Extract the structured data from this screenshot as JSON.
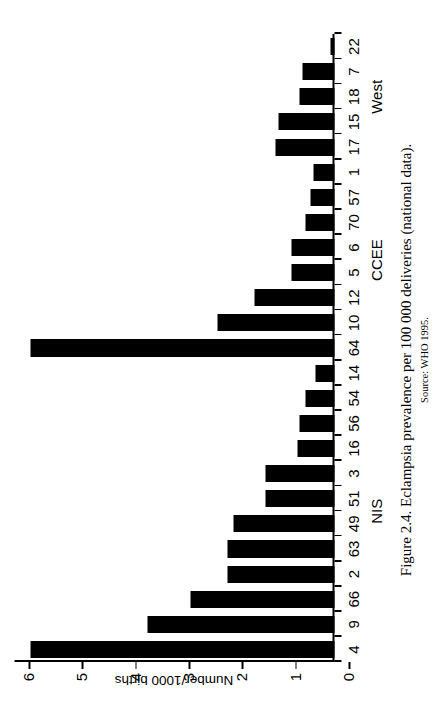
{
  "caption": {
    "main": "Figure 2.4. Eclampsia prevalence per 100 000 deliveries (national data).",
    "source": "Source: WHO 1995."
  },
  "chart_data": {
    "type": "bar",
    "orientation": "vertical-rotated-90ccw",
    "title": "Figure 2.4. Eclampsia prevalence per 100 000 deliveries (national data).",
    "xlabel": "",
    "ylabel": "Number/1000 births",
    "ylim": [
      0,
      6
    ],
    "yticks": [
      "0",
      "1",
      "2",
      "3",
      "4",
      "5",
      "6"
    ],
    "ytick_values": [
      0,
      1,
      2,
      3,
      4,
      5,
      6
    ],
    "grid": false,
    "legend": null,
    "categories": [
      "4",
      "9",
      "66",
      "2",
      "63",
      "49",
      "51",
      "3",
      "16",
      "56",
      "54",
      "14",
      "64",
      "10",
      "12",
      "5",
      "6",
      "70",
      "57",
      "1",
      "17",
      "15",
      "18",
      "7",
      "22"
    ],
    "values": [
      5.7,
      3.5,
      2.7,
      2.0,
      2.0,
      1.9,
      1.3,
      1.3,
      0.7,
      0.65,
      0.55,
      0.35,
      5.7,
      2.2,
      1.5,
      0.8,
      0.8,
      0.55,
      0.45,
      0.4,
      1.1,
      1.05,
      0.65,
      0.6,
      0.07
    ],
    "groups": [
      {
        "label": "NIS",
        "categories": [
          "4",
          "9",
          "66",
          "2",
          "63",
          "49",
          "51",
          "3",
          "16",
          "56",
          "54",
          "14"
        ]
      },
      {
        "label": "CCEE",
        "categories": [
          "64",
          "10",
          "12",
          "5",
          "6",
          "70",
          "57",
          "1"
        ]
      },
      {
        "label": "West",
        "categories": [
          "17",
          "15",
          "18",
          "7",
          "22"
        ]
      }
    ],
    "bar_color": "#000000"
  }
}
